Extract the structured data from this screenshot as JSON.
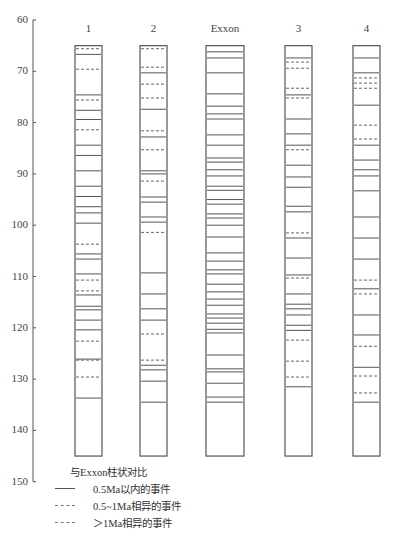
{
  "chart_data": {
    "type": "table",
    "title": "",
    "xlabel": "",
    "ylabel": "",
    "ylim": [
      60,
      150
    ],
    "y_ticks": [
      60,
      70,
      80,
      90,
      100,
      110,
      120,
      130,
      140,
      150
    ],
    "y_inverted": true,
    "grid": false,
    "column_range": [
      65,
      145
    ],
    "columns": [
      {
        "name": "1",
        "events": [
          {
            "age": 65.6,
            "style": "dash2"
          },
          {
            "age": 66.7,
            "style": "solid"
          },
          {
            "age": 69.6,
            "style": "dash2"
          },
          {
            "age": 74.6,
            "style": "solid"
          },
          {
            "age": 75.6,
            "style": "dash2"
          },
          {
            "age": 77.6,
            "style": "solid"
          },
          {
            "age": 79.4,
            "style": "solid"
          },
          {
            "age": 81.4,
            "style": "dash2"
          },
          {
            "age": 84.4,
            "style": "solid"
          },
          {
            "age": 86.4,
            "style": "solid"
          },
          {
            "age": 89.4,
            "style": "solid"
          },
          {
            "age": 92.4,
            "style": "solid"
          },
          {
            "age": 94.4,
            "style": "solid"
          },
          {
            "age": 96.4,
            "style": "solid"
          },
          {
            "age": 97.6,
            "style": "solid"
          },
          {
            "age": 99.6,
            "style": "solid"
          },
          {
            "age": 103.7,
            "style": "dash2"
          },
          {
            "age": 105.6,
            "style": "solid"
          },
          {
            "age": 106.6,
            "style": "solid"
          },
          {
            "age": 109.5,
            "style": "solid"
          },
          {
            "age": 110.7,
            "style": "dash2"
          },
          {
            "age": 112.8,
            "style": "dash2"
          },
          {
            "age": 113.6,
            "style": "solid"
          },
          {
            "age": 115.8,
            "style": "solid"
          },
          {
            "age": 116.5,
            "style": "solid"
          },
          {
            "age": 118.5,
            "style": "solid"
          },
          {
            "age": 120.4,
            "style": "solid"
          },
          {
            "age": 122.6,
            "style": "dash2"
          },
          {
            "age": 126.1,
            "style": "solid"
          },
          {
            "age": 126.3,
            "style": "dash2"
          },
          {
            "age": 129.6,
            "style": "dash2"
          },
          {
            "age": 133.7,
            "style": "solid"
          }
        ]
      },
      {
        "name": "2",
        "events": [
          {
            "age": 65.6,
            "style": "dash2"
          },
          {
            "age": 69.2,
            "style": "dash2"
          },
          {
            "age": 70.3,
            "style": "solid"
          },
          {
            "age": 72.5,
            "style": "dash2"
          },
          {
            "age": 75.2,
            "style": "dash2"
          },
          {
            "age": 77.4,
            "style": "solid"
          },
          {
            "age": 81.6,
            "style": "dash2"
          },
          {
            "age": 82.8,
            "style": "solid"
          },
          {
            "age": 85.3,
            "style": "dash2"
          },
          {
            "age": 89.4,
            "style": "solid"
          },
          {
            "age": 90.0,
            "style": "solid"
          },
          {
            "age": 91.4,
            "style": "dash2"
          },
          {
            "age": 94.5,
            "style": "solid"
          },
          {
            "age": 95.5,
            "style": "solid"
          },
          {
            "age": 98.4,
            "style": "solid"
          },
          {
            "age": 99.4,
            "style": "solid"
          },
          {
            "age": 101.4,
            "style": "dash2"
          },
          {
            "age": 109.3,
            "style": "solid"
          },
          {
            "age": 113.4,
            "style": "solid"
          },
          {
            "age": 116.3,
            "style": "solid"
          },
          {
            "age": 118.5,
            "style": "solid"
          },
          {
            "age": 121.2,
            "style": "dash2"
          },
          {
            "age": 126.3,
            "style": "dash2"
          },
          {
            "age": 127.3,
            "style": "solid"
          },
          {
            "age": 128.2,
            "style": "solid"
          },
          {
            "age": 130.4,
            "style": "solid"
          },
          {
            "age": 134.5,
            "style": "solid"
          }
        ]
      },
      {
        "name": "Exxon",
        "events": [
          {
            "age": 66.2,
            "style": "solid"
          },
          {
            "age": 67.4,
            "style": "solid"
          },
          {
            "age": 70.3,
            "style": "solid"
          },
          {
            "age": 74.4,
            "style": "solid"
          },
          {
            "age": 76.8,
            "style": "solid"
          },
          {
            "age": 78.3,
            "style": "solid"
          },
          {
            "age": 79.3,
            "style": "solid"
          },
          {
            "age": 82.4,
            "style": "solid"
          },
          {
            "age": 84.4,
            "style": "solid"
          },
          {
            "age": 86.9,
            "style": "solid"
          },
          {
            "age": 87.7,
            "style": "solid"
          },
          {
            "age": 89.2,
            "style": "solid"
          },
          {
            "age": 90.4,
            "style": "solid"
          },
          {
            "age": 92.4,
            "style": "solid"
          },
          {
            "age": 93.2,
            "style": "solid"
          },
          {
            "age": 95.0,
            "style": "solid"
          },
          {
            "age": 95.9,
            "style": "solid"
          },
          {
            "age": 97.8,
            "style": "solid"
          },
          {
            "age": 98.6,
            "style": "solid"
          },
          {
            "age": 100.0,
            "style": "solid"
          },
          {
            "age": 102.3,
            "style": "solid"
          },
          {
            "age": 105.4,
            "style": "solid"
          },
          {
            "age": 107.0,
            "style": "solid"
          },
          {
            "age": 108.7,
            "style": "solid"
          },
          {
            "age": 109.5,
            "style": "solid"
          },
          {
            "age": 111.5,
            "style": "solid"
          },
          {
            "age": 113.0,
            "style": "solid"
          },
          {
            "age": 114.4,
            "style": "solid"
          },
          {
            "age": 115.6,
            "style": "solid"
          },
          {
            "age": 117.3,
            "style": "solid"
          },
          {
            "age": 118.1,
            "style": "solid"
          },
          {
            "age": 119.1,
            "style": "solid"
          },
          {
            "age": 120.3,
            "style": "solid"
          },
          {
            "age": 121.0,
            "style": "solid"
          },
          {
            "age": 125.3,
            "style": "solid"
          },
          {
            "age": 128.0,
            "style": "solid"
          },
          {
            "age": 128.6,
            "style": "solid"
          },
          {
            "age": 130.8,
            "style": "solid"
          },
          {
            "age": 133.5,
            "style": "solid"
          },
          {
            "age": 134.5,
            "style": "solid"
          }
        ]
      },
      {
        "name": "3",
        "events": [
          {
            "age": 67.4,
            "style": "solid"
          },
          {
            "age": 68.2,
            "style": "dash2"
          },
          {
            "age": 69.4,
            "style": "dash2"
          },
          {
            "age": 73.3,
            "style": "dash2"
          },
          {
            "age": 74.6,
            "style": "solid"
          },
          {
            "age": 75.2,
            "style": "dash2"
          },
          {
            "age": 79.3,
            "style": "solid"
          },
          {
            "age": 82.2,
            "style": "solid"
          },
          {
            "age": 84.4,
            "style": "solid"
          },
          {
            "age": 85.3,
            "style": "dash2"
          },
          {
            "age": 88.3,
            "style": "solid"
          },
          {
            "age": 90.6,
            "style": "solid"
          },
          {
            "age": 92.6,
            "style": "solid"
          },
          {
            "age": 96.3,
            "style": "solid"
          },
          {
            "age": 97.4,
            "style": "solid"
          },
          {
            "age": 101.5,
            "style": "dash2"
          },
          {
            "age": 102.5,
            "style": "solid"
          },
          {
            "age": 106.4,
            "style": "solid"
          },
          {
            "age": 109.7,
            "style": "solid"
          },
          {
            "age": 110.3,
            "style": "dash2"
          },
          {
            "age": 113.4,
            "style": "solid"
          },
          {
            "age": 115.4,
            "style": "solid"
          },
          {
            "age": 116.3,
            "style": "solid"
          },
          {
            "age": 117.5,
            "style": "solid"
          },
          {
            "age": 119.5,
            "style": "solid"
          },
          {
            "age": 120.5,
            "style": "solid"
          },
          {
            "age": 122.4,
            "style": "dash2"
          },
          {
            "age": 126.5,
            "style": "dash2"
          },
          {
            "age": 129.6,
            "style": "dash2"
          },
          {
            "age": 131.5,
            "style": "solid"
          }
        ]
      },
      {
        "name": "4",
        "events": [
          {
            "age": 67.4,
            "style": "solid"
          },
          {
            "age": 70.3,
            "style": "solid"
          },
          {
            "age": 71.3,
            "style": "dash2"
          },
          {
            "age": 72.3,
            "style": "dash2"
          },
          {
            "age": 73.3,
            "style": "dash2"
          },
          {
            "age": 76.6,
            "style": "solid"
          },
          {
            "age": 80.5,
            "style": "dash2"
          },
          {
            "age": 83.2,
            "style": "dash2"
          },
          {
            "age": 84.4,
            "style": "solid"
          },
          {
            "age": 87.3,
            "style": "solid"
          },
          {
            "age": 89.2,
            "style": "solid"
          },
          {
            "age": 90.4,
            "style": "solid"
          },
          {
            "age": 93.3,
            "style": "solid"
          },
          {
            "age": 98.4,
            "style": "solid"
          },
          {
            "age": 102.5,
            "style": "solid"
          },
          {
            "age": 106.6,
            "style": "solid"
          },
          {
            "age": 110.7,
            "style": "dash2"
          },
          {
            "age": 112.4,
            "style": "solid"
          },
          {
            "age": 113.4,
            "style": "dash2"
          },
          {
            "age": 117.5,
            "style": "solid"
          },
          {
            "age": 121.4,
            "style": "solid"
          },
          {
            "age": 123.6,
            "style": "dash2"
          },
          {
            "age": 127.7,
            "style": "solid"
          },
          {
            "age": 129.4,
            "style": "dash2"
          },
          {
            "age": 132.7,
            "style": "dash2"
          },
          {
            "age": 134.5,
            "style": "solid"
          }
        ]
      }
    ],
    "legend": {
      "title": "与Exxon柱状对比",
      "entries": [
        {
          "style": "solid",
          "label": "0.5Ma以内的事件"
        },
        {
          "style": "dash1",
          "label": "0.5~1Ma相异的事件"
        },
        {
          "style": "dash2",
          "label": "＞1Ma相异的事件"
        }
      ],
      "position": "bottom-left"
    }
  },
  "colors": {
    "line": "#555555",
    "axis": "#555555",
    "text": "#444444"
  }
}
